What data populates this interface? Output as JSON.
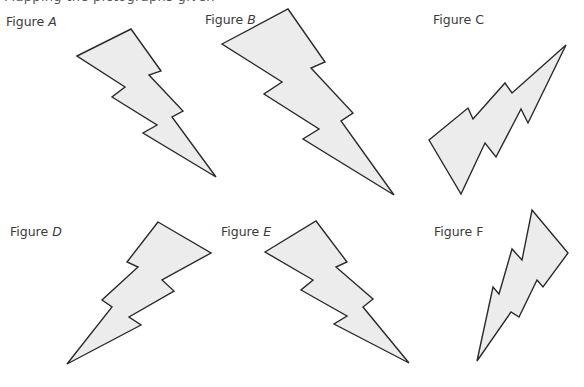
{
  "cutoff_text": "Mapping the pictographs given",
  "figures": [
    {
      "id": "A",
      "prefix": "Figure ",
      "letter": "A",
      "letter_italic": true,
      "label_pos": [
        6,
        14
      ],
      "points": "77,56 131,29 161,71 149,75 183,111 172,117 216,177 143,133 157,125 112,97 125,87"
    },
    {
      "id": "B",
      "prefix": "Figure ",
      "letter": "B",
      "letter_italic": true,
      "label_pos": [
        205,
        12
      ],
      "points": "222,44 288,9 325,62 311,68 353,113 341,121 394,195 303,139 319,129 264,94 282,82"
    },
    {
      "id": "C",
      "prefix": "Figure ",
      "letter": "C",
      "letter_italic": false,
      "label_pos": [
        433,
        12
      ],
      "points": "429,140 468,108 473,119 505,83 512,93 566,45 528,123 521,109 496,157 485,143 461,194"
    },
    {
      "id": "D",
      "prefix": "Figure ",
      "letter": "D",
      "letter_italic": true,
      "label_pos": [
        10,
        224
      ],
      "points": "158,222 211,253 162,280 174,291 129,317 141,325 67,364 112,307 102,300 138,267 127,262"
    },
    {
      "id": "E",
      "prefix": "Figure ",
      "letter": "E",
      "letter_italic": true,
      "label_pos": [
        221,
        224
      ],
      "points": "265,252 316,221 347,262 336,267 373,299 363,307 409,363 334,324 347,316 301,290 313,280"
    },
    {
      "id": "F",
      "prefix": "Figure ",
      "letter": "F",
      "letter_italic": false,
      "label_pos": [
        434,
        224
      ],
      "points": "532,210 568,253 543,287 537,280 519,317 511,312 477,361 493,287 499,294 512,249 522,260"
    }
  ],
  "colors": {
    "fill": "#ececec",
    "stroke": "#2a2a2a",
    "label": "#3a3a3a"
  }
}
